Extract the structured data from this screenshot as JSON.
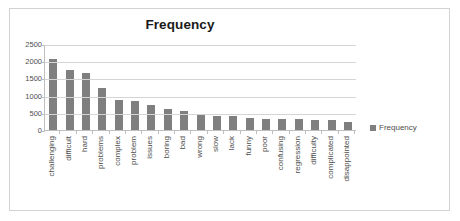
{
  "chart_data": {
    "type": "bar",
    "title": "Frequency",
    "xlabel": "",
    "ylabel": "",
    "ylim": [
      0,
      2500
    ],
    "yticks": [
      0,
      500,
      1000,
      1500,
      2000,
      2500
    ],
    "ytick_labels": [
      "0",
      "500",
      "1000",
      "1500",
      "2000",
      "2500"
    ],
    "grid": true,
    "legend": [
      "Frequency"
    ],
    "legend_position": "right",
    "series_color": "#7f7f7f",
    "categories": [
      "challenging",
      "difficult",
      "hard",
      "problems",
      "complex",
      "problem",
      "issues",
      "boring",
      "bad",
      "wrong",
      "slow",
      "lack",
      "funny",
      "poor",
      "confusing",
      "regression",
      "difficulty",
      "complicated",
      "disappointed"
    ],
    "values": [
      2100,
      1760,
      1670,
      1250,
      870,
      840,
      730,
      620,
      570,
      440,
      420,
      400,
      340,
      330,
      320,
      310,
      290,
      280,
      230
    ],
    "series": [
      {
        "name": "Frequency",
        "values": [
          2100,
          1760,
          1670,
          1250,
          870,
          840,
          730,
          620,
          570,
          440,
          420,
          400,
          340,
          330,
          320,
          310,
          290,
          280,
          230
        ]
      }
    ]
  },
  "legend": {
    "swatch_name": "legend-swatch",
    "label": "Frequency"
  }
}
